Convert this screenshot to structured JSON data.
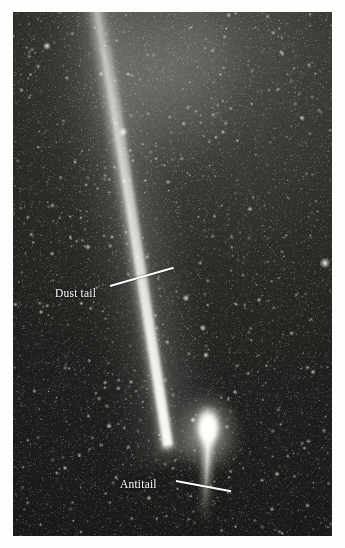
{
  "figure": {
    "type": "astronomical-photograph",
    "plate_background_color": "#1b1b1b",
    "page_background_color": "#ffffff",
    "annotation_color": "#ffffff"
  },
  "annotations": [
    {
      "id": "dust-tail",
      "label": "Dust tail",
      "label_x": 42,
      "label_y": 275,
      "leader_from_x": 97,
      "leader_from_y": 273,
      "leader_to_x": 160,
      "leader_to_y": 255
    },
    {
      "id": "antitail",
      "label": "Antitail",
      "label_x": 107,
      "label_y": 466,
      "leader_from_x": 163,
      "leader_from_y": 468,
      "leader_to_x": 218,
      "leader_to_y": 478
    }
  ],
  "features": {
    "coma": {
      "x": 207,
      "y": 428,
      "description": "bright comet coma and nucleus"
    },
    "dust_tail": {
      "description": "long narrow bright streak extending from the coma toward the upper left",
      "angle_deg": -9.3
    },
    "antitail": {
      "description": "narrow sunward spike extending below the coma",
      "angle_deg": 2.5
    }
  }
}
